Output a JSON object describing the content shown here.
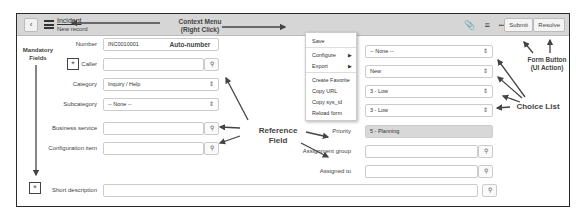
{
  "header": {
    "back_icon": "chevron-left-icon",
    "menu_icon": "hamburger-icon",
    "title": "Incident",
    "subtitle": "New record",
    "icons": [
      "paperclip-icon",
      "sliders-icon",
      "more-icon"
    ],
    "more_glyph": "•••",
    "buttons": {
      "submit": "Submit",
      "resolve": "Resolve"
    }
  },
  "context_menu": {
    "items": [
      {
        "label": "Save",
        "submenu": false
      },
      {
        "label": "Configure",
        "submenu": true
      },
      {
        "label": "Export",
        "submenu": true
      },
      {
        "label": "Create Favorite",
        "submenu": false
      },
      {
        "label": "Copy URL",
        "submenu": false
      },
      {
        "label": "Copy sys_id",
        "submenu": false
      },
      {
        "label": "Reload form",
        "submenu": false
      }
    ],
    "submenu_glyph": "▶"
  },
  "form": {
    "left": [
      {
        "label": "Number",
        "value": "INC0010001",
        "type": "text"
      },
      {
        "label": "Caller",
        "value": "",
        "type": "reference",
        "mandatory": true
      },
      {
        "label": "Category",
        "value": "Inquiry / Help",
        "type": "choice"
      },
      {
        "label": "Subcategory",
        "value": "-- None --",
        "type": "choice"
      },
      {
        "label": "Business service",
        "value": "",
        "type": "reference"
      },
      {
        "label": "Configuration item",
        "value": "",
        "type": "reference"
      }
    ],
    "right": [
      {
        "label": "Contact type",
        "value": "-- None --",
        "type": "choice"
      },
      {
        "label": "State",
        "value": "New",
        "type": "choice"
      },
      {
        "label": "Impact",
        "value": "3 - Low",
        "type": "choice"
      },
      {
        "label": "Urgency",
        "value": "3 - Low",
        "type": "choice"
      },
      {
        "label": "Priority",
        "value": "5 - Planning",
        "type": "readonly"
      },
      {
        "label": "Assignment group",
        "value": "",
        "type": "reference"
      },
      {
        "label": "Assigned to",
        "value": "",
        "type": "reference"
      }
    ],
    "short_description": {
      "label": "Short description",
      "value": "",
      "mandatory": true,
      "icon": "lightbulb-icon"
    },
    "mandatory_glyph": "*",
    "caret_glyph": "⇕",
    "search_glyph": "⚲"
  },
  "annotations": {
    "context_menu": "Context Menu\n(Right Click)",
    "auto_number": "Auto-number",
    "mandatory": "Mandatory\nFields",
    "reference": "Reference\nField",
    "choice_list": "Choice List",
    "form_button": "Form Button\n(UI Action)"
  }
}
